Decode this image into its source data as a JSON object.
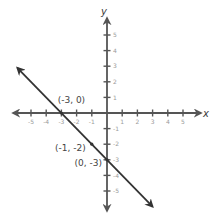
{
  "chart_data": {
    "type": "line",
    "title": "",
    "xlabel": "x",
    "ylabel": "y",
    "xlim": [
      -5.5,
      5.5
    ],
    "ylim": [
      -5.5,
      5.5
    ],
    "grid": false,
    "x_ticks": [
      -5,
      -4,
      -3,
      -2,
      -1,
      1,
      2,
      3,
      4,
      5
    ],
    "y_ticks": [
      5,
      4,
      3,
      2,
      1,
      -1,
      -2,
      -3,
      -4,
      -5
    ],
    "x_tick_labels": [
      "-5",
      "-4",
      "-3",
      "-2",
      "-1",
      "1",
      "2",
      "3",
      "4",
      "5"
    ],
    "y_tick_labels": [
      "5",
      "4",
      "3",
      "2",
      "1",
      "-1",
      "-2",
      "-3",
      "-4",
      "-5"
    ],
    "series": [
      {
        "name": "y = -x - 3",
        "equation": "y = -x - 3",
        "slope": -1,
        "intercept": -3,
        "x": [
          -5.9,
          3
        ],
        "y": [
          2.9,
          -6
        ],
        "arrows": "both"
      }
    ],
    "annotations": [
      {
        "label": "(-3, 0)",
        "x": -3,
        "y": 0
      },
      {
        "label": "(-1, -2)",
        "x": -1,
        "y": -2
      },
      {
        "label": "(0, -3)",
        "x": 0,
        "y": -3
      }
    ]
  },
  "colors": {
    "axis": "#555555",
    "line": "#333333",
    "tick_label": "#9a9a9a",
    "point_label": "#444444"
  }
}
